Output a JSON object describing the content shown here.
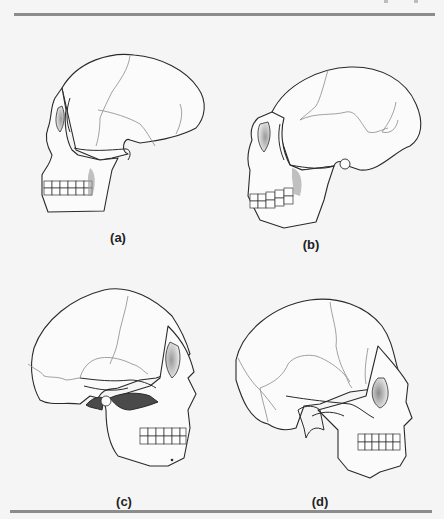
{
  "figure": {
    "panels": [
      {
        "id": "a",
        "label": "(a)"
      },
      {
        "id": "b",
        "label": "(b)"
      },
      {
        "id": "c",
        "label": "(c)"
      },
      {
        "id": "d",
        "label": "(d)"
      }
    ]
  },
  "colors": {
    "background": "#f5f5f5",
    "rule": "#8c8c8c",
    "outline": "#2a2a2a",
    "suture": "#8a8a8a",
    "shadow": "#4a4a4a"
  }
}
